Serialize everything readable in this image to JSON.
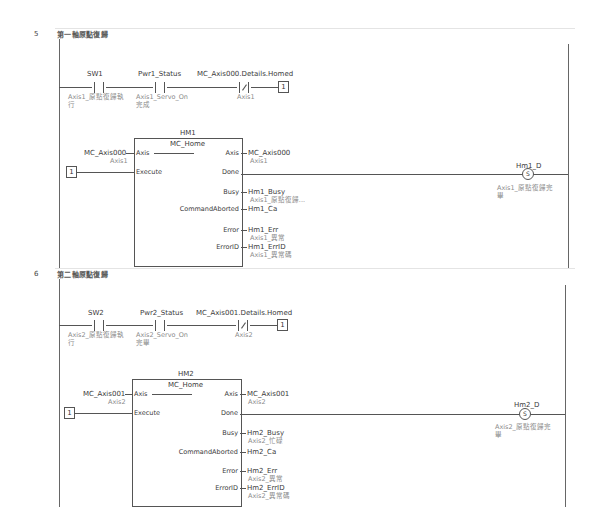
{
  "rungs": [
    {
      "number": "5",
      "comment": "第一軸原點復歸",
      "contacts": [
        {
          "variable": "SW1",
          "comment": "Axis1_原點復歸執",
          "comment2": "行",
          "type": "NO"
        },
        {
          "variable": "Pwr1_Status",
          "comment": "Axis1_Servo_On",
          "comment2": "完成",
          "type": "NO"
        },
        {
          "variable": "MC_Axis000.Details.Homed",
          "comment": "Axis1",
          "type": "NC"
        }
      ],
      "contact_output_const": "1",
      "fb": {
        "instance": "HM1",
        "type": "MC_Home",
        "inputs": [
          {
            "pin": "Axis",
            "var": "MC_Axis000",
            "comment": "Axis1"
          },
          {
            "pin": "Execute",
            "const": "1"
          }
        ],
        "outputs": [
          {
            "pin": "Axis",
            "var": "MC_Axis000",
            "comment": "Axis1"
          },
          {
            "pin": "Done",
            "var": ""
          },
          {
            "pin": "Busy",
            "var": "Hm1_Busy",
            "comment": "Axis1_原點復歸..."
          },
          {
            "pin": "CommandAborted",
            "var": "Hm1_Ca",
            "comment": ""
          },
          {
            "pin": "Error",
            "var": "Hm1_Err",
            "comment": "Axis1_異常"
          },
          {
            "pin": "ErrorID",
            "var": "Hm1_ErrID",
            "comment": "Axis1_異常碼"
          }
        ]
      },
      "coil": {
        "variable": "Hm1_D",
        "symbol": "S",
        "comment": "Axis1_原點復歸完",
        "comment2": "畢"
      }
    },
    {
      "number": "6",
      "comment": "第二軸原點復歸",
      "contacts": [
        {
          "variable": "SW2",
          "comment": "Axis2_原點復歸執",
          "comment2": "行",
          "type": "NO"
        },
        {
          "variable": "Pwr2_Status",
          "comment": "Axis2_Servo_On",
          "comment2": "完畢",
          "type": "NO"
        },
        {
          "variable": "MC_Axis001.Details.Homed",
          "comment": "Axis2",
          "type": "NC"
        }
      ],
      "contact_output_const": "1",
      "fb": {
        "instance": "HM2",
        "type": "MC_Home",
        "inputs": [
          {
            "pin": "Axis",
            "var": "MC_Axis001",
            "comment": "Axis2"
          },
          {
            "pin": "Execute",
            "const": "1"
          }
        ],
        "outputs": [
          {
            "pin": "Axis",
            "var": "MC_Axis001",
            "comment": "Axis2"
          },
          {
            "pin": "Done",
            "var": ""
          },
          {
            "pin": "Busy",
            "var": "Hm2_Busy",
            "comment": "Axis2_忙碌"
          },
          {
            "pin": "CommandAborted",
            "var": "Hm2_Ca",
            "comment": ""
          },
          {
            "pin": "Error",
            "var": "Hm2_Err",
            "comment": "Axis2_異常"
          },
          {
            "pin": "ErrorID",
            "var": "Hm2_ErrID",
            "comment": "Axis2_異常碼"
          }
        ]
      },
      "coil": {
        "variable": "Hm2_D",
        "symbol": "S",
        "comment": "Axis2_原點復歸完",
        "comment2": "畢"
      }
    }
  ]
}
